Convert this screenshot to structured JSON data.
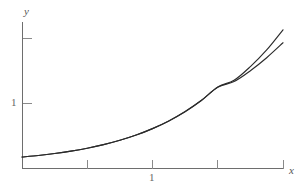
{
  "figure": {
    "background_color": "#ffffff",
    "curve_color": "#2b2b2b",
    "axis_color": "#6e6e6e",
    "tick_color": "#8a8a8a",
    "label_color": "#666666"
  },
  "axes": {
    "x_axis_label": "x",
    "y_axis_label": "y",
    "x_tick_labels": [
      "",
      "1",
      "",
      ""
    ],
    "y_tick_labels": [
      "",
      "1"
    ]
  },
  "chart_data": {
    "type": "line",
    "title": "",
    "subtitle": "",
    "xlabel": "x",
    "ylabel": "y",
    "xlim": [
      -2.0,
      2.0
    ],
    "ylim": [
      0.0,
      2.25
    ],
    "grid": false,
    "legend": "none",
    "xticks": [
      -1.0,
      0.0,
      1.0,
      2.0
    ],
    "xticklabels": [
      "",
      "1",
      "",
      ""
    ],
    "yticks": [
      1.0,
      2.0
    ],
    "yticklabels": [
      "1",
      ""
    ],
    "annotations": [],
    "series": [
      {
        "name": "upper-curve",
        "comment": "exponential-like curve, upper branch",
        "x": [
          -2.0,
          -1.75,
          -1.5,
          -1.25,
          -1.0,
          -0.75,
          -0.5,
          -0.25,
          0.0,
          0.25,
          0.5,
          0.75,
          1.0,
          1.25,
          1.5,
          1.75,
          2.0
        ],
        "values": [
          0.169,
          0.193,
          0.223,
          0.26,
          0.305,
          0.36,
          0.427,
          0.508,
          0.607,
          0.726,
          0.87,
          1.043,
          1.25,
          1.352,
          1.563,
          1.82,
          2.13
        ]
      },
      {
        "name": "lower-curve",
        "comment": "approximating curve, tangent near x = 1",
        "x": [
          -2.0,
          -1.75,
          -1.5,
          -1.25,
          -1.0,
          -0.75,
          -0.5,
          -0.25,
          0.0,
          0.25,
          0.5,
          0.75,
          1.0,
          1.25,
          1.5,
          1.75,
          2.0
        ],
        "values": [
          0.169,
          0.193,
          0.223,
          0.26,
          0.305,
          0.36,
          0.427,
          0.508,
          0.607,
          0.726,
          0.868,
          1.04,
          1.244,
          1.333,
          1.5,
          1.7,
          1.93
        ]
      }
    ]
  }
}
